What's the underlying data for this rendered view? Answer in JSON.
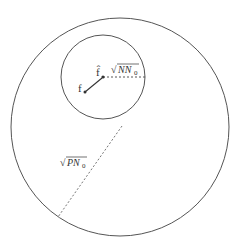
{
  "diagram": {
    "outer_circle": {
      "cx": 120,
      "cy": 127,
      "r": 109,
      "color": "#555555"
    },
    "inner_circle": {
      "cx": 103,
      "cy": 77,
      "r": 42,
      "color": "#555555"
    },
    "points": {
      "f": {
        "x": 85,
        "y": 92,
        "label": "f"
      },
      "f_hat": {
        "x": 103,
        "y": 77,
        "label": "f̂"
      }
    },
    "labels": {
      "inner_radius": "√NN₀",
      "outer_radius": "√PN₀",
      "inner_radius_sqrt": "√",
      "inner_radius_body": "NN",
      "inner_radius_sub": "0",
      "outer_radius_sqrt": "√",
      "outer_radius_body": "PN",
      "outer_radius_sub": "0"
    }
  }
}
